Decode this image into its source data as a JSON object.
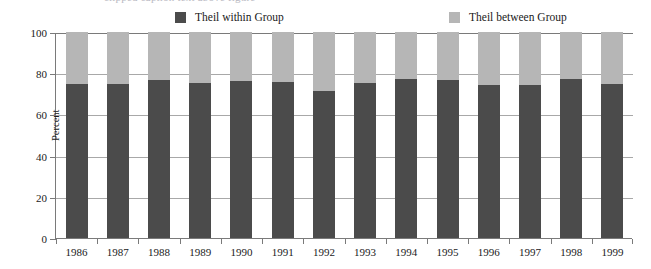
{
  "top_caption": "clipped caption text above figure",
  "legend": {
    "position": "top",
    "items": [
      {
        "label": "Theil within Group",
        "color": "#4b4b4b",
        "swatch": "dark-swatch"
      },
      {
        "label": "Theil between Group",
        "color": "#b6b6b6",
        "swatch": "light-swatch"
      }
    ]
  },
  "axes": {
    "ylabel": "Percent",
    "yticks": [
      0,
      20,
      40,
      60,
      80,
      100
    ],
    "ylim": [
      0,
      100
    ],
    "xlabel": "",
    "grid": true
  },
  "chart_data": {
    "type": "bar",
    "stacked": true,
    "title": "",
    "subtitle": "",
    "xlabel": "",
    "ylabel": "Percent",
    "ylim": [
      0,
      100
    ],
    "yticks": [
      0,
      20,
      40,
      60,
      80,
      100
    ],
    "grid": true,
    "legend_position": "top",
    "categories": [
      "1986",
      "1987",
      "1988",
      "1989",
      "1990",
      "1991",
      "1992",
      "1993",
      "1994",
      "1995",
      "1996",
      "1997",
      "1998",
      "1999"
    ],
    "series": [
      {
        "name": "Theil within Group",
        "color": "#4b4b4b",
        "values": [
          75.0,
          74.8,
          76.5,
          75.2,
          76.0,
          75.6,
          71.3,
          75.3,
          77.0,
          76.5,
          74.5,
          74.3,
          77.0,
          74.8
        ]
      },
      {
        "name": "Theil between Group",
        "color": "#b6b6b6",
        "values": [
          25.0,
          25.2,
          23.5,
          24.8,
          24.0,
          24.4,
          28.7,
          24.7,
          23.0,
          23.5,
          25.5,
          25.7,
          23.0,
          25.2
        ]
      }
    ]
  }
}
